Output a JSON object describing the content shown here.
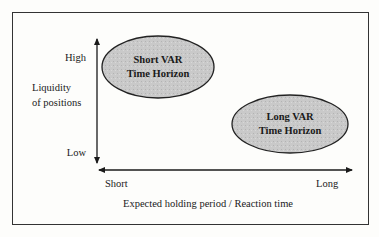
{
  "diagram": {
    "y_axis": {
      "title_line1": "Liquidity",
      "title_line2": "of positions",
      "high_label": "High",
      "low_label": "Low"
    },
    "x_axis": {
      "title": "Expected holding period / Reaction time",
      "short_label": "Short",
      "long_label": "Long"
    },
    "nodes": [
      {
        "id": "short-var",
        "line1": "Short VAR",
        "line2": "Time Horizon",
        "fill": "#c9c9c9"
      },
      {
        "id": "long-var",
        "line1": "Long VAR",
        "line2": "Time Horizon",
        "fill": "#c9c9c9"
      }
    ],
    "colors": {
      "border": "#333333",
      "axis": "#1a1a1a",
      "ellipse_fill": "#c9c9c9"
    }
  }
}
